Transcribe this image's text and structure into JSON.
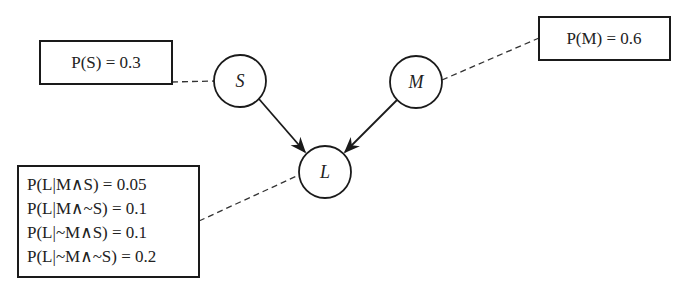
{
  "diagram": {
    "type": "bayesian-network",
    "nodes": [
      {
        "id": "S",
        "label": "S",
        "cx": 240,
        "cy": 81,
        "r": 26
      },
      {
        "id": "M",
        "label": "M",
        "cx": 416,
        "cy": 82,
        "r": 26
      },
      {
        "id": "L",
        "label": "L",
        "cx": 325,
        "cy": 172,
        "r": 26
      }
    ],
    "edges": [
      {
        "from": "S",
        "to": "L"
      },
      {
        "from": "M",
        "to": "L"
      }
    ],
    "probability_boxes": {
      "S": {
        "lines": [
          "P(S) = 0.3"
        ]
      },
      "M": {
        "lines": [
          "P(M) = 0.6"
        ]
      },
      "L": {
        "lines": [
          "P(L|M∧S) = 0.05",
          "P(L|M∧~S) = 0.1",
          "P(L|~M∧S) = 0.1",
          "P(L|~M∧~S) = 0.2"
        ]
      }
    },
    "colors": {
      "stroke": "#1a1a1a",
      "dashed": "#333333",
      "background": "#ffffff"
    }
  }
}
